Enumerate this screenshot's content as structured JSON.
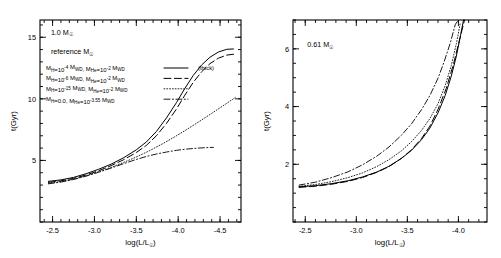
{
  "figure": {
    "type": "line-chart-pair",
    "background": "#ffffff",
    "line_color": "#000000"
  },
  "chart_data": [
    {
      "type": "line",
      "panel": "left",
      "title": "",
      "xlabel": "log(L/L☉)",
      "ylabel": "t(Gyr)",
      "xlim": [
        -2.35,
        -4.75
      ],
      "ylim": [
        0,
        16.4
      ],
      "x_ticks": [
        -2.5,
        -3.0,
        -3.5,
        -4.0,
        -4.5
      ],
      "x_tick_labels": [
        "-2.5",
        "-3.0",
        "-3.5",
        "-4.0",
        "-4.5"
      ],
      "y_ticks": [
        5,
        10,
        15
      ],
      "y_tick_labels": [
        "5",
        "10",
        "15"
      ],
      "x_minor_step": 0.1,
      "y_minor_step": 1,
      "grid": false,
      "legend_position": "upper-left",
      "annotations": [
        {
          "text": "1.0 M☉",
          "x": -2.48,
          "y": 15.2
        },
        {
          "text": "reference C/O",
          "x": -2.48,
          "y": 13.6
        }
      ],
      "series": [
        {
          "name": "MH=1e-4 MWD, MHe=1e-2 MWD",
          "style": "solid",
          "note": "(thick)",
          "points": [
            [
              -2.45,
              3.3
            ],
            [
              -2.6,
              3.42
            ],
            [
              -2.75,
              3.62
            ],
            [
              -2.9,
              3.92
            ],
            [
              -3.05,
              4.28
            ],
            [
              -3.2,
              4.7
            ],
            [
              -3.35,
              5.22
            ],
            [
              -3.5,
              5.86
            ],
            [
              -3.62,
              6.5
            ],
            [
              -3.74,
              7.35
            ],
            [
              -3.86,
              8.45
            ],
            [
              -3.98,
              9.7
            ],
            [
              -4.08,
              10.85
            ],
            [
              -4.18,
              11.9
            ],
            [
              -4.28,
              12.75
            ],
            [
              -4.38,
              13.38
            ],
            [
              -4.48,
              13.8
            ],
            [
              -4.58,
              14.02
            ],
            [
              -4.66,
              14.05
            ]
          ]
        },
        {
          "name": "MH=1e-6 MWD, MHe=1e-2 MWD",
          "style": "dashed",
          "points": [
            [
              -2.45,
              3.22
            ],
            [
              -2.6,
              3.34
            ],
            [
              -2.75,
              3.54
            ],
            [
              -2.9,
              3.82
            ],
            [
              -3.05,
              4.16
            ],
            [
              -3.2,
              4.58
            ],
            [
              -3.35,
              5.06
            ],
            [
              -3.5,
              5.64
            ],
            [
              -3.62,
              6.22
            ],
            [
              -3.74,
              7.0
            ],
            [
              -3.86,
              8.0
            ],
            [
              -3.98,
              9.18
            ],
            [
              -4.08,
              10.3
            ],
            [
              -4.18,
              11.34
            ],
            [
              -4.28,
              12.2
            ],
            [
              -4.38,
              12.86
            ],
            [
              -4.48,
              13.3
            ],
            [
              -4.58,
              13.55
            ],
            [
              -4.66,
              13.62
            ]
          ]
        },
        {
          "name": "MH=1e-15 MWD, MHe=1e-2 MWD",
          "style": "dotted",
          "points": [
            [
              -2.45,
              3.15
            ],
            [
              -2.6,
              3.28
            ],
            [
              -2.75,
              3.48
            ],
            [
              -2.9,
              3.76
            ],
            [
              -3.05,
              4.08
            ],
            [
              -3.2,
              4.44
            ],
            [
              -3.35,
              4.84
            ],
            [
              -3.5,
              5.28
            ],
            [
              -3.65,
              5.76
            ],
            [
              -3.8,
              6.3
            ],
            [
              -3.95,
              6.88
            ],
            [
              -4.1,
              7.5
            ],
            [
              -4.25,
              8.15
            ],
            [
              -4.4,
              8.82
            ],
            [
              -4.55,
              9.5
            ],
            [
              -4.68,
              10.1
            ]
          ]
        },
        {
          "name": "MH=0.0, MHe=1e-3.55 MWD",
          "style": "dash-dot",
          "points": [
            [
              -2.45,
              3.1
            ],
            [
              -2.6,
              3.24
            ],
            [
              -2.75,
              3.45
            ],
            [
              -2.9,
              3.72
            ],
            [
              -3.05,
              4.04
            ],
            [
              -3.2,
              4.38
            ],
            [
              -3.35,
              4.74
            ],
            [
              -3.5,
              5.08
            ],
            [
              -3.62,
              5.32
            ],
            [
              -3.74,
              5.52
            ],
            [
              -3.86,
              5.68
            ],
            [
              -3.98,
              5.82
            ],
            [
              -4.1,
              5.92
            ],
            [
              -4.22,
              5.99
            ],
            [
              -4.34,
              6.04
            ],
            [
              -4.42,
              6.06
            ]
          ]
        }
      ],
      "legend_entries": [
        {
          "m_h_base": "M",
          "m_h_sub": "H",
          "m_h_val": "=10",
          "m_h_exp": "-4",
          "m_h_unit": " M",
          "m_h_unit_sub": "WD",
          "m_he_base": ", M",
          "m_he_sub": "He",
          "m_he_val": "=10",
          "m_he_exp": "-2",
          "m_he_unit": " M",
          "m_he_unit_sub": "WD",
          "style": "solid",
          "extra": "(thick)"
        },
        {
          "m_h_base": "M",
          "m_h_sub": "H",
          "m_h_val": "=10",
          "m_h_exp": "-6",
          "m_h_unit": " M",
          "m_h_unit_sub": "WD",
          "m_he_base": ", M",
          "m_he_sub": "He",
          "m_he_val": "=10",
          "m_he_exp": "-2",
          "m_he_unit": " M",
          "m_he_unit_sub": "WD",
          "style": "dashed",
          "extra": ""
        },
        {
          "m_h_base": "M",
          "m_h_sub": "H",
          "m_h_val": "=10",
          "m_h_exp": "-15",
          "m_h_unit": " M",
          "m_h_unit_sub": "WD",
          "m_he_base": ", M",
          "m_he_sub": "He",
          "m_he_val": "=10",
          "m_he_exp": "-2",
          "m_he_unit": " M",
          "m_he_unit_sub": "WD",
          "style": "dotted",
          "extra": ""
        },
        {
          "m_h_base": "M",
          "m_h_sub": "H",
          "m_h_val": "=0.0",
          "m_h_exp": "",
          "m_h_unit": "",
          "m_h_unit_sub": "",
          "m_he_base": ", M",
          "m_he_sub": "He",
          "m_he_val": "=10",
          "m_he_exp": "-3.55",
          "m_he_unit": " M",
          "m_he_unit_sub": "WD",
          "style": "dash-dot",
          "extra": ""
        }
      ]
    },
    {
      "type": "line",
      "panel": "right",
      "title": "",
      "xlabel": "log(L/L☉)",
      "ylabel": "t(Gyr)",
      "xlim": [
        -2.38,
        -4.28
      ],
      "ylim": [
        0,
        7.0
      ],
      "x_ticks": [
        -2.5,
        -3.0,
        -3.5,
        -4.0
      ],
      "x_tick_labels": [
        "-2.5",
        "-3.0",
        "-3.5",
        "-4.0"
      ],
      "y_ticks": [
        2,
        4,
        6
      ],
      "y_tick_labels": [
        "2",
        "4",
        "6"
      ],
      "x_minor_step": 0.1,
      "y_minor_step": 0.5,
      "grid": false,
      "legend_position": "none",
      "annotations": [
        {
          "text": "0.61 M☉",
          "x": -2.52,
          "y": 6.05
        }
      ],
      "series": [
        {
          "name": "MH=1e-4 MWD, MHe=1e-2 MWD",
          "style": "solid",
          "points": [
            [
              -2.44,
              1.22
            ],
            [
              -2.6,
              1.26
            ],
            [
              -2.76,
              1.33
            ],
            [
              -2.92,
              1.43
            ],
            [
              -3.06,
              1.56
            ],
            [
              -3.2,
              1.73
            ],
            [
              -3.32,
              1.93
            ],
            [
              -3.44,
              2.2
            ],
            [
              -3.54,
              2.48
            ],
            [
              -3.64,
              2.86
            ],
            [
              -3.72,
              3.25
            ],
            [
              -3.8,
              3.78
            ],
            [
              -3.87,
              4.38
            ],
            [
              -3.93,
              5.05
            ],
            [
              -3.98,
              5.75
            ],
            [
              -4.02,
              6.45
            ],
            [
              -4.05,
              7.0
            ]
          ]
        },
        {
          "name": "MH=1e-6 MWD, MHe=1e-2 MWD",
          "style": "dashed",
          "points": [
            [
              -2.44,
              1.2
            ],
            [
              -2.6,
              1.24
            ],
            [
              -2.76,
              1.31
            ],
            [
              -2.92,
              1.41
            ],
            [
              -3.06,
              1.54
            ],
            [
              -3.2,
              1.72
            ],
            [
              -3.32,
              1.92
            ],
            [
              -3.44,
              2.2
            ],
            [
              -3.54,
              2.5
            ],
            [
              -3.64,
              2.9
            ],
            [
              -3.72,
              3.32
            ],
            [
              -3.8,
              3.9
            ],
            [
              -3.88,
              4.62
            ],
            [
              -3.95,
              5.45
            ],
            [
              -4.01,
              6.3
            ],
            [
              -4.06,
              7.0
            ]
          ]
        },
        {
          "name": "MH=1e-15 MWD, MHe=1e-2 MWD",
          "style": "dotted",
          "points": [
            [
              -2.44,
              1.24
            ],
            [
              -2.6,
              1.3
            ],
            [
              -2.76,
              1.4
            ],
            [
              -2.92,
              1.54
            ],
            [
              -3.06,
              1.7
            ],
            [
              -3.2,
              1.92
            ],
            [
              -3.32,
              2.16
            ],
            [
              -3.44,
              2.46
            ],
            [
              -3.54,
              2.78
            ],
            [
              -3.64,
              3.18
            ],
            [
              -3.72,
              3.58
            ],
            [
              -3.8,
              4.1
            ],
            [
              -3.87,
              4.72
            ],
            [
              -3.93,
              5.42
            ],
            [
              -3.98,
              6.18
            ],
            [
              -4.02,
              6.92
            ]
          ]
        },
        {
          "name": "MH=0.0, MHe=1e-3.55 MWD",
          "style": "dash-dot",
          "points": [
            [
              -2.44,
              1.28
            ],
            [
              -2.6,
              1.38
            ],
            [
              -2.76,
              1.54
            ],
            [
              -2.92,
              1.74
            ],
            [
              -3.06,
              1.98
            ],
            [
              -3.2,
              2.28
            ],
            [
              -3.32,
              2.6
            ],
            [
              -3.44,
              3.0
            ],
            [
              -3.54,
              3.4
            ],
            [
              -3.64,
              3.9
            ],
            [
              -3.72,
              4.38
            ],
            [
              -3.8,
              4.98
            ],
            [
              -3.86,
              5.55
            ],
            [
              -3.92,
              6.2
            ],
            [
              -3.97,
              6.85
            ],
            [
              -4.0,
              7.0
            ]
          ]
        }
      ]
    }
  ]
}
